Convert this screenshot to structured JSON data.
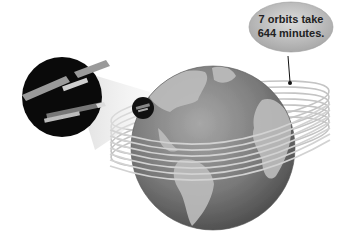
{
  "diagram": {
    "callout": {
      "line1": "7 orbits take",
      "line2": "644 minutes."
    },
    "elements": {
      "earth": "globe",
      "orbits_count": 7,
      "satellite": "space-station",
      "magnifier": "zoom-inset"
    },
    "colors": {
      "background": "#ffffff",
      "ocean": "#7a7a7a",
      "land": "#bdbdbd",
      "callout_fill": "#c8c8c8",
      "inset": "#0a0a0a"
    }
  }
}
